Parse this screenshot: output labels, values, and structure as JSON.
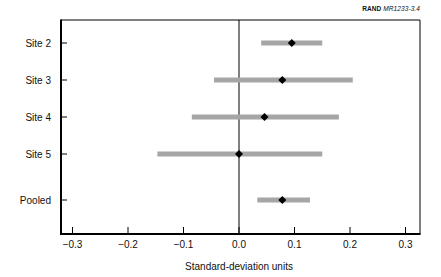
{
  "figure_tag": {
    "prefix": "RAND",
    "code": "MR1233-3.4"
  },
  "chart_data": {
    "type": "forest",
    "title": "",
    "xlabel": "Standard-deviation units",
    "ylabel": "",
    "xlim": [
      -0.32,
      0.325
    ],
    "xticks": [
      -0.3,
      -0.2,
      -0.1,
      0.0,
      0.1,
      0.2,
      0.3
    ],
    "xtick_labels": [
      "−0.3",
      "−0.2",
      "−0.1",
      "0.0",
      "0.1",
      "0.2",
      "0.3"
    ],
    "reference_line": 0.0,
    "grid": false,
    "legend": null,
    "categories": [
      "Site 2",
      "Site 3",
      "Site 4",
      "Site 5",
      "Pooled"
    ],
    "series": [
      {
        "name": "Effect estimate",
        "points": [
          {
            "label": "Site 2",
            "estimate": 0.095,
            "lower": 0.04,
            "upper": 0.15
          },
          {
            "label": "Site 3",
            "estimate": 0.078,
            "lower": -0.045,
            "upper": 0.205
          },
          {
            "label": "Site 4",
            "estimate": 0.046,
            "lower": -0.085,
            "upper": 0.18
          },
          {
            "label": "Site 5",
            "estimate": 0.0,
            "lower": -0.147,
            "upper": 0.15
          },
          {
            "label": "Pooled",
            "estimate": 0.078,
            "lower": 0.033,
            "upper": 0.128
          }
        ]
      }
    ],
    "colors": {
      "interval_bar": "#a6a6a6",
      "marker": "#000000",
      "axis": "#000000"
    }
  }
}
